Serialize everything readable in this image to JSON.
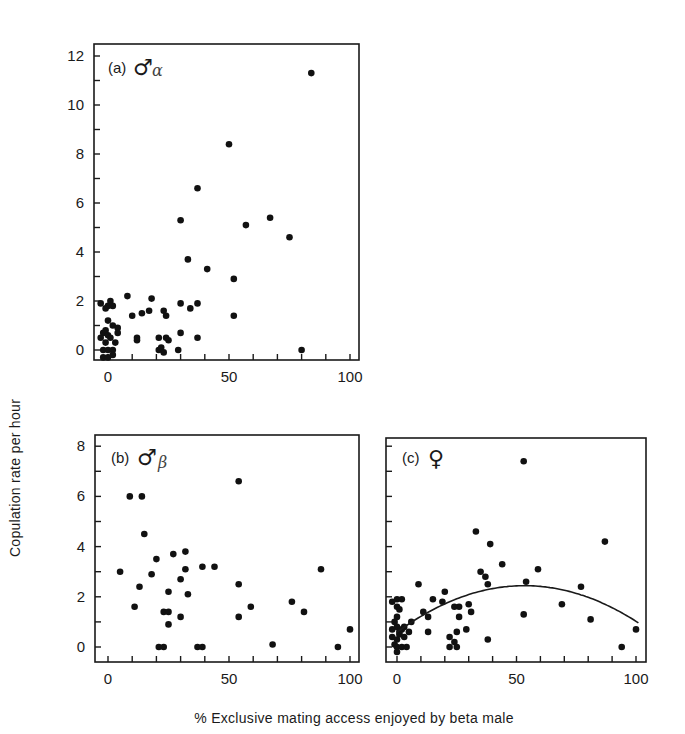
{
  "figure": {
    "y_axis_title": "Copulation rate per hour",
    "x_axis_title": "% Exclusive mating access enjoyed by beta male"
  },
  "panels": [
    {
      "id": "a",
      "label": "(a)",
      "symbol": "♂",
      "subscript": "α",
      "x_ticks": [
        "0",
        "50",
        "100"
      ],
      "y_ticks": [
        "0",
        "2",
        "4",
        "6",
        "8",
        "10",
        "12"
      ]
    },
    {
      "id": "b",
      "label": "(b)",
      "symbol": "♂",
      "subscript": "β",
      "x_ticks": [
        "0",
        "50",
        "100"
      ],
      "y_ticks": [
        "0",
        "2",
        "4",
        "6",
        "8"
      ]
    },
    {
      "id": "c",
      "label": "(c)",
      "symbol": "♀",
      "subscript": "",
      "x_ticks": [
        "0",
        "50",
        "100"
      ],
      "y_ticks": []
    }
  ],
  "chart_data": [
    {
      "type": "scatter",
      "title": "(a) ♂α",
      "xlabel": "% Exclusive mating access enjoyed by beta male",
      "ylabel": "Copulation rate per hour",
      "xlim": [
        -5,
        105
      ],
      "ylim": [
        -0.5,
        12.5
      ],
      "x_ticks": [
        0,
        50,
        100
      ],
      "y_ticks": [
        0,
        2,
        4,
        6,
        8,
        10,
        12
      ],
      "grid": false,
      "points": [
        [
          84,
          11.3
        ],
        [
          50,
          8.4
        ],
        [
          37,
          6.6
        ],
        [
          30,
          5.3
        ],
        [
          67,
          5.4
        ],
        [
          57,
          5.1
        ],
        [
          75,
          4.6
        ],
        [
          33,
          3.7
        ],
        [
          41,
          3.3
        ],
        [
          52,
          2.9
        ],
        [
          52,
          1.4
        ],
        [
          80,
          0.0
        ],
        [
          8,
          2.2
        ],
        [
          18,
          2.1
        ],
        [
          30,
          1.9
        ],
        [
          37,
          1.9
        ],
        [
          34,
          1.7
        ],
        [
          23,
          1.6
        ],
        [
          17,
          1.6
        ],
        [
          14,
          1.5
        ],
        [
          10,
          1.4
        ],
        [
          24,
          1.4
        ],
        [
          30,
          0.7
        ],
        [
          37,
          0.5
        ],
        [
          12,
          0.5
        ],
        [
          12,
          0.4
        ],
        [
          21,
          0.5
        ],
        [
          24,
          0.5
        ],
        [
          25,
          0.4
        ],
        [
          21,
          0.0
        ],
        [
          22,
          0.1
        ],
        [
          23,
          -0.1
        ],
        [
          29,
          0.0
        ],
        [
          -3,
          1.9
        ],
        [
          0,
          1.8
        ],
        [
          1,
          2.0
        ],
        [
          2,
          1.8
        ],
        [
          -1,
          1.7
        ],
        [
          0,
          1.2
        ],
        [
          2,
          1.0
        ],
        [
          4,
          0.9
        ],
        [
          4,
          0.7
        ],
        [
          -2,
          0.7
        ],
        [
          -1,
          0.8
        ],
        [
          0,
          0.6
        ],
        [
          -3,
          0.5
        ],
        [
          1,
          0.5
        ],
        [
          3,
          0.3
        ],
        [
          -1,
          0.3
        ],
        [
          -2,
          0.0
        ],
        [
          0,
          0.0
        ],
        [
          2,
          0.0
        ],
        [
          -2,
          -0.3
        ],
        [
          0,
          -0.3
        ],
        [
          2,
          -0.2
        ]
      ]
    },
    {
      "type": "scatter",
      "title": "(b) ♂β",
      "xlabel": "% Exclusive mating access enjoyed by beta male",
      "ylabel": "Copulation rate per hour",
      "xlim": [
        -5,
        105
      ],
      "ylim": [
        -0.3,
        8.5
      ],
      "x_ticks": [
        0,
        50,
        100
      ],
      "y_ticks": [
        0,
        2,
        4,
        6,
        8
      ],
      "grid": false,
      "points": [
        [
          54,
          6.6
        ],
        [
          9,
          6.0
        ],
        [
          14,
          6.0
        ],
        [
          15,
          4.5
        ],
        [
          32,
          3.8
        ],
        [
          27,
          3.7
        ],
        [
          20,
          3.5
        ],
        [
          32,
          3.1
        ],
        [
          39,
          3.2
        ],
        [
          44,
          3.2
        ],
        [
          88,
          3.1
        ],
        [
          5,
          3.0
        ],
        [
          18,
          2.9
        ],
        [
          30,
          2.7
        ],
        [
          54,
          2.5
        ],
        [
          13,
          2.4
        ],
        [
          25,
          2.2
        ],
        [
          33,
          2.1
        ],
        [
          76,
          1.8
        ],
        [
          59,
          1.6
        ],
        [
          11,
          1.6
        ],
        [
          81,
          1.4
        ],
        [
          23,
          1.4
        ],
        [
          25,
          1.4
        ],
        [
          30,
          1.2
        ],
        [
          54,
          1.2
        ],
        [
          25,
          0.9
        ],
        [
          100,
          0.7
        ],
        [
          21,
          0.0
        ],
        [
          23,
          0.0
        ],
        [
          37,
          0.0
        ],
        [
          39,
          0.0
        ],
        [
          68,
          0.1
        ],
        [
          95,
          0.0
        ]
      ]
    },
    {
      "type": "scatter",
      "title": "(c) ♀",
      "xlabel": "% Exclusive mating access enjoyed by beta male",
      "ylabel": "Copulation rate per hour",
      "xlim": [
        -5,
        105
      ],
      "ylim": [
        -0.3,
        8.5
      ],
      "x_ticks": [
        0,
        50,
        100
      ],
      "y_ticks": [
        0,
        2,
        4,
        6,
        8
      ],
      "grid": false,
      "points": [
        [
          53,
          7.4
        ],
        [
          33,
          4.6
        ],
        [
          39,
          4.1
        ],
        [
          87,
          4.2
        ],
        [
          44,
          3.3
        ],
        [
          59,
          3.1
        ],
        [
          35,
          3.0
        ],
        [
          37,
          2.8
        ],
        [
          38,
          2.5
        ],
        [
          54,
          2.6
        ],
        [
          77,
          2.4
        ],
        [
          9,
          2.5
        ],
        [
          20,
          2.2
        ],
        [
          15,
          1.9
        ],
        [
          19,
          1.8
        ],
        [
          30,
          1.7
        ],
        [
          26,
          1.6
        ],
        [
          24,
          1.6
        ],
        [
          69,
          1.7
        ],
        [
          11,
          1.4
        ],
        [
          31,
          1.4
        ],
        [
          26,
          1.2
        ],
        [
          13,
          1.2
        ],
        [
          53,
          1.3
        ],
        [
          81,
          1.1
        ],
        [
          29,
          0.7
        ],
        [
          13,
          0.6
        ],
        [
          22,
          0.4
        ],
        [
          25,
          0.6
        ],
        [
          38,
          0.3
        ],
        [
          100,
          0.7
        ],
        [
          24,
          0.2
        ],
        [
          22,
          0.0
        ],
        [
          25,
          0.0
        ],
        [
          94,
          0.0
        ],
        [
          0,
          1.9
        ],
        [
          -2,
          1.8
        ],
        [
          2,
          1.9
        ],
        [
          0,
          1.6
        ],
        [
          1,
          1.5
        ],
        [
          0,
          1.2
        ],
        [
          -1,
          1.0
        ],
        [
          3,
          0.8
        ],
        [
          6,
          1.0
        ],
        [
          -2,
          0.7
        ],
        [
          0,
          0.8
        ],
        [
          2,
          0.7
        ],
        [
          1,
          0.6
        ],
        [
          5,
          0.6
        ],
        [
          -2,
          0.4
        ],
        [
          0,
          0.3
        ],
        [
          1,
          0.5
        ],
        [
          3,
          0.4
        ],
        [
          -1,
          0.1
        ],
        [
          0,
          0.0
        ],
        [
          2,
          0.0
        ],
        [
          4,
          0.0
        ],
        [
          0,
          -0.2
        ]
      ],
      "fitted_curve": {
        "type": "quadratic",
        "description": "Inverted-U fit peaking near x=52",
        "x": [
          0,
          10,
          20,
          30,
          40,
          50,
          60,
          70,
          80,
          90,
          100
        ],
        "y": [
          0.6,
          1.2,
          1.7,
          2.1,
          2.35,
          2.45,
          2.42,
          2.25,
          1.95,
          1.55,
          1.05
        ]
      }
    }
  ]
}
